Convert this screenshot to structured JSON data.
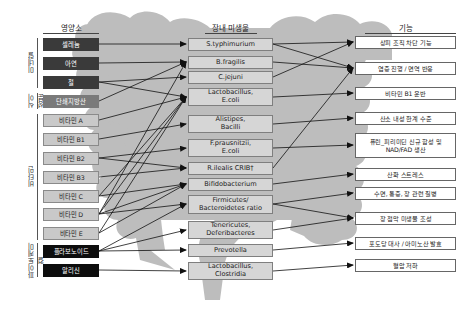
{
  "headers": {
    "nutrients": "영양소",
    "microbes": "장내 미생물",
    "functions": "기능"
  },
  "groups": [
    {
      "label": "미네랄"
    },
    {
      "label": "식이 성분"
    },
    {
      "label": "비타민"
    },
    {
      "label": "파이토케미컬"
    }
  ],
  "nutrients": [
    {
      "label": "셀레늄",
      "style": "dark"
    },
    {
      "label": "아연",
      "style": "dark"
    },
    {
      "label": "철",
      "style": "dark"
    },
    {
      "label": "단쇄지방산",
      "style": "mid"
    },
    {
      "label": "비타민 A",
      "style": "light"
    },
    {
      "label": "비타민 B1",
      "style": "light"
    },
    {
      "label": "비타민 B2",
      "style": "light"
    },
    {
      "label": "비타민 B3",
      "style": "light"
    },
    {
      "label": "비타민 C",
      "style": "light"
    },
    {
      "label": "비타민 D",
      "style": "light"
    },
    {
      "label": "비타민 E",
      "style": "light"
    },
    {
      "label": "플라보노이드",
      "style": "black"
    },
    {
      "label": "알리신",
      "style": "black"
    }
  ],
  "microbes": [
    {
      "line1": "S.typhimurium",
      "line2": ""
    },
    {
      "line1": "B.fragilis",
      "line2": ""
    },
    {
      "line1": "C.jejuni",
      "line2": ""
    },
    {
      "line1": "Lactobacillus,",
      "line2": "E.coli"
    },
    {
      "line1": "Alistipes,",
      "line2": "Bacilli"
    },
    {
      "line1": "F.prausnitzii,",
      "line2": "E.coli"
    },
    {
      "line1": "R.ilealis CRIB†",
      "line2": ""
    },
    {
      "line1": "Bifidobacterium",
      "line2": ""
    },
    {
      "line1": "Firmicutes/",
      "line2": "Bacteroidetes ratio"
    },
    {
      "line1": "Tenericutes,",
      "line2": "Deferibacteres"
    },
    {
      "line1": "Prevotella",
      "line2": ""
    },
    {
      "line1": "Lactobacillus,",
      "line2": "Clostridia"
    }
  ],
  "functions": [
    {
      "line1": "상피 조직 차단 기능",
      "line2": ""
    },
    {
      "line1": "염증 진행 / 면역 반응",
      "line2": ""
    },
    {
      "line1": "비타민 B1 운반",
      "line2": ""
    },
    {
      "line1": "산소 내성 한계 수준",
      "line2": ""
    },
    {
      "line1": "퓨린_피리미딘 신규 합성 및",
      "line2": "NAD/FAD 생산"
    },
    {
      "line1": "산화 스트레스",
      "line2": ""
    },
    {
      "line1": "수면, 통증, 장 관련 질병",
      "line2": ""
    },
    {
      "line1": "장 점막 미생물 조성",
      "line2": ""
    },
    {
      "line1": "포도당 대사 / 아미노산 발효",
      "line2": ""
    },
    {
      "line1": "혈압 저하",
      "line2": ""
    }
  ],
  "colors": {
    "dark": "#3a3a3a",
    "mid": "#7a7a7a",
    "light": "#c9c9c9",
    "black": "#0d0d0d",
    "intestine": "#b8b8b8",
    "arrow": "#111111"
  }
}
